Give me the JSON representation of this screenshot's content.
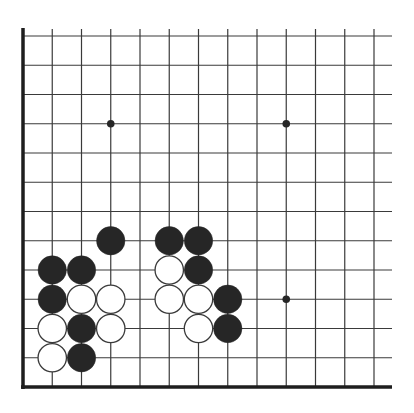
{
  "board": {
    "size_visible_columns": 13,
    "size_visible_rows": 13,
    "corner": "bottom-left",
    "colors": {
      "background": "#ffffff",
      "line": "#3a3a3a",
      "edge": "#1e1e1e",
      "black_stone": "#262626",
      "white_stone": "#ffffff",
      "white_stone_outline": "#3a3a3a",
      "star_point": "#262626"
    },
    "star_points": [
      {
        "col": 3,
        "row": 9
      },
      {
        "col": 9,
        "row": 9
      },
      {
        "col": 9,
        "row": 3
      }
    ],
    "stones": [
      {
        "color": "black",
        "col": 3,
        "row": 5
      },
      {
        "color": "black",
        "col": 5,
        "row": 5
      },
      {
        "color": "black",
        "col": 6,
        "row": 5
      },
      {
        "color": "black",
        "col": 1,
        "row": 4
      },
      {
        "color": "black",
        "col": 2,
        "row": 4
      },
      {
        "color": "white",
        "col": 5,
        "row": 4
      },
      {
        "color": "black",
        "col": 6,
        "row": 4
      },
      {
        "color": "black",
        "col": 1,
        "row": 3
      },
      {
        "color": "white",
        "col": 2,
        "row": 3
      },
      {
        "color": "white",
        "col": 3,
        "row": 3
      },
      {
        "color": "white",
        "col": 5,
        "row": 3
      },
      {
        "color": "white",
        "col": 6,
        "row": 3
      },
      {
        "color": "black",
        "col": 7,
        "row": 3
      },
      {
        "color": "white",
        "col": 1,
        "row": 2
      },
      {
        "color": "black",
        "col": 2,
        "row": 2
      },
      {
        "color": "white",
        "col": 3,
        "row": 2
      },
      {
        "color": "white",
        "col": 6,
        "row": 2
      },
      {
        "color": "black",
        "col": 7,
        "row": 2
      },
      {
        "color": "white",
        "col": 1,
        "row": 1
      },
      {
        "color": "black",
        "col": 2,
        "row": 1
      }
    ]
  }
}
